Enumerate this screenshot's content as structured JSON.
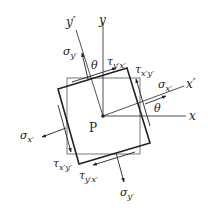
{
  "diagram": {
    "point_label": "P",
    "axes": {
      "x": "x",
      "y": "y",
      "x_prime": "x′",
      "y_prime": "y′"
    },
    "angles": {
      "theta_top": "θ",
      "theta_right": "θ"
    },
    "stresses": {
      "sigma_x_prime_right": {
        "symbol": "σ",
        "sub": "x′"
      },
      "sigma_x_prime_left": {
        "symbol": "σ",
        "sub": "x′"
      },
      "sigma_y_prime_top": {
        "symbol": "σ",
        "sub": "y′"
      },
      "sigma_y_prime_bottom": {
        "symbol": "σ",
        "sub": "y′"
      },
      "tau_y_prime_x_prime_top": {
        "symbol": "τ",
        "sub": "y′x′"
      },
      "tau_x_prime_y_prime_right": {
        "symbol": "τ",
        "sub": "x′y′"
      },
      "tau_x_prime_y_prime_left": {
        "symbol": "τ",
        "sub": "x′y′"
      },
      "tau_y_prime_x_prime_bottom": {
        "symbol": "τ",
        "sub": "y′x′"
      }
    },
    "colors": {
      "line": "#222222",
      "background": "#ffffff"
    }
  }
}
